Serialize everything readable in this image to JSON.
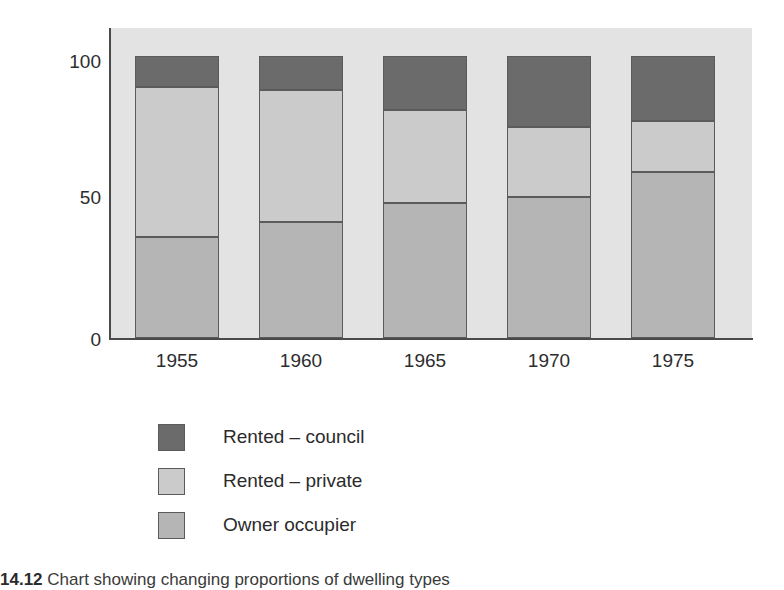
{
  "figure": {
    "caption_number": "14.12",
    "caption_text": "Chart showing changing proportions of dwelling types"
  },
  "axes": {
    "ylabel": "Percentage",
    "yticks": [
      "0",
      "50",
      "100"
    ],
    "xticks": [
      "1955",
      "1960",
      "1965",
      "1970",
      "1975"
    ]
  },
  "legend": {
    "items": [
      {
        "label": "Rented – council",
        "key": "council",
        "color": "#6b6b6b"
      },
      {
        "label": "Rented – private",
        "key": "private",
        "color": "#cbcbcb"
      },
      {
        "label": "Owner occupier",
        "key": "owner",
        "color": "#b5b5b5"
      }
    ]
  },
  "colors": {
    "plot_background": "#e3e3e3",
    "axis": "#4a4a4a",
    "segment_border": "#5b5b5b",
    "rented_council": "#6b6b6b",
    "rented_private": "#cbcbcb",
    "owner_occupier": "#b5b5b5"
  },
  "chart_data": {
    "type": "bar",
    "stacked": true,
    "title": "",
    "xlabel": "",
    "ylabel": "Percentage",
    "ylim": [
      0,
      110
    ],
    "ytick_values": [
      0,
      50,
      100
    ],
    "grid": false,
    "legend_position": "below",
    "categories": [
      "1955",
      "1960",
      "1965",
      "1970",
      "1975"
    ],
    "series": [
      {
        "name": "Owner occupier",
        "values": [
          36,
          41,
          48,
          50,
          59
        ]
      },
      {
        "name": "Rented – private",
        "values": [
          53,
          47,
          33,
          25,
          18
        ]
      },
      {
        "name": "Rented – council",
        "values": [
          11,
          12,
          19,
          25,
          23
        ]
      }
    ],
    "cumulative_tops": {
      "owner_occupier": [
        36,
        41,
        48,
        50,
        59
      ],
      "rented_private": [
        89,
        88,
        81,
        75,
        77
      ],
      "rented_council": [
        100,
        100,
        100,
        100,
        100
      ]
    },
    "annotations": []
  }
}
